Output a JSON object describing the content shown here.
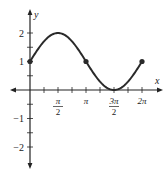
{
  "chart_data": {
    "type": "line",
    "title": "",
    "function": "y = 1 + sin(x)",
    "xlabel": "x",
    "ylabel": "y",
    "xlim": [
      0,
      6.283
    ],
    "ylim": [
      -2.5,
      2.5
    ],
    "grid": false,
    "x_ticks": [
      {
        "value": 1.5708,
        "num": "π",
        "den": "2"
      },
      {
        "value": 3.1416,
        "label": "π"
      },
      {
        "value": 4.7124,
        "num": "3π",
        "den": "2"
      },
      {
        "value": 6.2832,
        "label": "2π"
      }
    ],
    "y_ticks": [
      {
        "value": 2,
        "label": "2"
      },
      {
        "value": 1,
        "label": "1"
      },
      {
        "value": -1,
        "label": "−1"
      },
      {
        "value": -2,
        "label": "−2"
      }
    ],
    "series": [
      {
        "name": "1 + sin x",
        "x": [
          0,
          0.7854,
          1.5708,
          2.3562,
          3.1416,
          3.927,
          4.7124,
          5.4978,
          6.2832
        ],
        "values": [
          1,
          1.707,
          2,
          1.707,
          1,
          0.293,
          0,
          0.293,
          1
        ]
      }
    ],
    "marked_points": [
      {
        "x": 0,
        "y": 1
      },
      {
        "x": 3.1416,
        "y": 1
      },
      {
        "x": 6.2832,
        "y": 1
      }
    ],
    "color": "#2a2a2a"
  }
}
